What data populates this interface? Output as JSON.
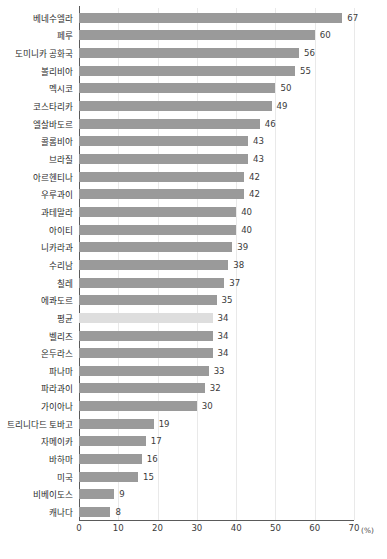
{
  "chart_data": {
    "type": "bar",
    "orientation": "horizontal",
    "title": "",
    "xlabel": "(%)",
    "ylabel": "",
    "xlim": [
      0,
      70
    ],
    "xticks": [
      0,
      10,
      20,
      30,
      40,
      50,
      60,
      70
    ],
    "grid": true,
    "legend": "none",
    "highlight_category": "평균",
    "colors": {
      "bar": "#9a9a9a",
      "average_bar": "#dedede",
      "axis": "#5a5a5a",
      "gridline": "#e9e9e9",
      "text": "#2b2b2b"
    },
    "categories": [
      "베네수엘라",
      "페루",
      "도미니카 공화국",
      "볼리비아",
      "멕시코",
      "코스타리카",
      "엘살바도르",
      "콜롬비아",
      "브라질",
      "아르헨티나",
      "우루과이",
      "과테말라",
      "아이티",
      "니카라과",
      "수리남",
      "칠레",
      "에콰도르",
      "평균",
      "벨리즈",
      "온두라스",
      "파나마",
      "파라과이",
      "가이아나",
      "트리니다드 토바고",
      "자메이카",
      "바하마",
      "미국",
      "비베이도스",
      "캐나다"
    ],
    "values": [
      67,
      60,
      56,
      55,
      50,
      49,
      46,
      43,
      43,
      42,
      42,
      40,
      40,
      39,
      38,
      37,
      35,
      34,
      34,
      34,
      33,
      32,
      30,
      19,
      17,
      16,
      15,
      9,
      8
    ]
  }
}
